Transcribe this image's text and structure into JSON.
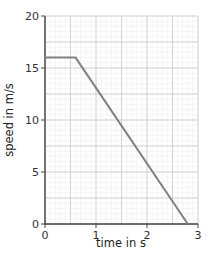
{
  "chart_data": {
    "type": "line",
    "title": "",
    "xlabel": "time in s",
    "ylabel": "speed in m/s",
    "xlim": [
      0,
      3
    ],
    "ylim": [
      0,
      20
    ],
    "x_ticks": [
      0,
      1,
      2,
      3
    ],
    "y_ticks": [
      0,
      5,
      10,
      15,
      20
    ],
    "x_tick_labels": [
      "0",
      "1",
      "2",
      "3"
    ],
    "y_tick_labels": [
      "0",
      "5",
      "10",
      "15",
      "20"
    ],
    "grid": true,
    "grid_major": {
      "x_step": 0.5,
      "y_step": 2.5
    },
    "grid_minor": {
      "x_step": 0.1,
      "y_step": 0.5
    },
    "legend": null,
    "series": [
      {
        "name": "speed",
        "x": [
          0,
          0.6,
          2.8
        ],
        "y": [
          16,
          16,
          0
        ],
        "color": "#808080"
      }
    ]
  },
  "colors": {
    "axis": "#444444",
    "grid_major": "#cfcfcf",
    "grid_minor": "#ececec",
    "line": "#808080"
  }
}
